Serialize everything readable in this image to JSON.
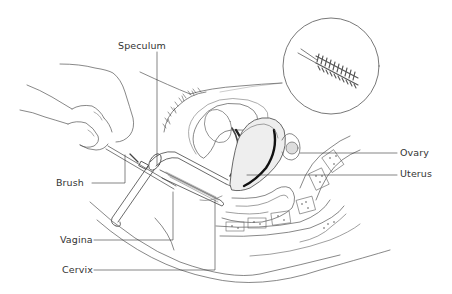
{
  "figure": {
    "type": "anatomical illustration",
    "background": "#ffffff",
    "ink_color": "#333333"
  },
  "labels": {
    "speculum": "Speculum",
    "brush": "Brush",
    "vagina": "Vagina",
    "cervix": "Cervix",
    "ovary": "Ovary",
    "uterus": "Uterus"
  },
  "inset": {
    "content": "magnified cervical brush",
    "shape": "circle"
  }
}
